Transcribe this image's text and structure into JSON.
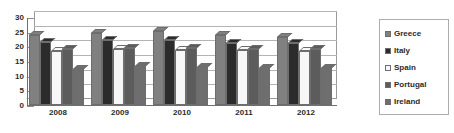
{
  "chart_data": {
    "type": "bar",
    "title": "",
    "xlabel": "",
    "ylabel": "",
    "categories": [
      "2008",
      "2009",
      "2010",
      "2011",
      "2012"
    ],
    "series": [
      {
        "name": "Greece",
        "color": "#808080",
        "values": [
          24.0,
          24.6,
          25.4,
          23.8,
          23.3
        ]
      },
      {
        "name": "Italy",
        "color": "#2b2b2b",
        "values": [
          21.6,
          22.2,
          22.0,
          21.2,
          21.3
        ]
      },
      {
        "name": "Spain",
        "color": "#f7f7f7",
        "values": [
          18.5,
          19.0,
          18.7,
          18.8,
          18.5
        ]
      },
      {
        "name": "Portugal",
        "color": "#5c5c5c",
        "values": [
          19.0,
          19.4,
          19.3,
          19.0,
          19.0
        ]
      },
      {
        "name": "Ireland",
        "color": "#6e6e6e",
        "values": [
          12.2,
          13.2,
          13.0,
          12.7,
          12.5
        ]
      }
    ],
    "ylim": [
      0,
      30
    ],
    "yticks": [
      "0",
      "5",
      "10",
      "15",
      "20",
      "25",
      "30"
    ],
    "grid": true,
    "legend_position": "right",
    "legend_entries": [
      "Greece",
      "Italy",
      "Spain",
      "Portugal",
      "Ireland"
    ]
  }
}
